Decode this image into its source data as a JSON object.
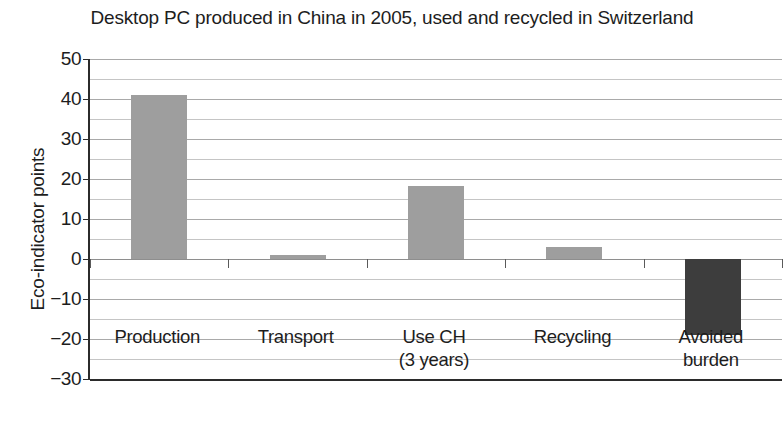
{
  "chart_data": {
    "type": "bar",
    "title": "Desktop PC produced in China in 2005, used and recycled in Switzerland",
    "xlabel": "",
    "ylabel": "Eco-indicator points",
    "categories": [
      "Production",
      "Transport",
      "Use CH\n(3 years)",
      "Recycling",
      "Avoided\nburden"
    ],
    "category_lines": [
      [
        "Production"
      ],
      [
        "Transport"
      ],
      [
        "Use CH",
        "(3 years)"
      ],
      [
        "Recycling"
      ],
      [
        "Avoided",
        "burden"
      ]
    ],
    "values": [
      41,
      1,
      18.3,
      3,
      -19
    ],
    "bar_colors": [
      "#9e9e9e",
      "#9e9e9e",
      "#9e9e9e",
      "#9e9e9e",
      "#3d3d3d"
    ],
    "ylim": [
      -30,
      50
    ],
    "ytick_values": [
      50,
      40,
      30,
      20,
      10,
      0,
      -10,
      -20,
      -30
    ],
    "ytick_labels": [
      "50",
      "40",
      "30",
      "20",
      "10",
      "0",
      "−10",
      "−20",
      "−30"
    ],
    "minor_tick_step": 5,
    "grid": true,
    "grid_axis": "y",
    "legend": null
  },
  "colors": {
    "background": "#ffffff",
    "axis": "#2b2b2b",
    "gridline_major": "#a9a9a9",
    "gridline_minor": "#c5c5c5",
    "bar_light": "#9e9e9e",
    "bar_dark": "#3d3d3d",
    "text": "#1d1d1d"
  }
}
